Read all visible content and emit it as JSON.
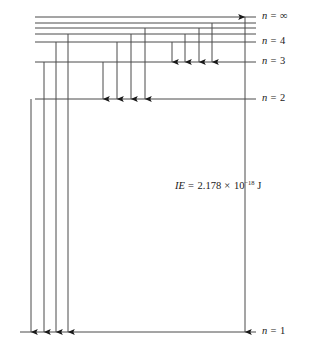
{
  "diagram": {
    "stroke_color": "#4a4a4a",
    "text_color": "#1a1a1a",
    "background": "#ffffff"
  },
  "levels": [
    {
      "id": "n-infinity",
      "label_n": "n",
      "label_eq": "=",
      "label_value": "∞",
      "y": 17,
      "x_start": 35,
      "x_end": 256,
      "label_x": 262,
      "label_y": 11
    },
    {
      "id": "n-7",
      "label_n": "",
      "label_eq": "",
      "label_value": "",
      "y": 23,
      "x_start": 35,
      "x_end": 256,
      "label_x": 0,
      "label_y": 0
    },
    {
      "id": "n-6",
      "label_n": "",
      "label_eq": "",
      "label_value": "",
      "y": 28,
      "x_start": 35,
      "x_end": 256,
      "label_x": 0,
      "label_y": 0
    },
    {
      "id": "n-5",
      "label_n": "",
      "label_eq": "",
      "label_value": "",
      "y": 34,
      "x_start": 35,
      "x_end": 256,
      "label_x": 0,
      "label_y": 0
    },
    {
      "id": "n-4",
      "label_n": "n",
      "label_eq": "=",
      "label_value": "4",
      "y": 42,
      "x_start": 35,
      "x_end": 256,
      "label_x": 262,
      "label_y": 36
    },
    {
      "id": "n-3",
      "label_n": "n",
      "label_eq": "=",
      "label_value": "3",
      "y": 62,
      "x_start": 35,
      "x_end": 256,
      "label_x": 262,
      "label_y": 56
    },
    {
      "id": "n-2",
      "label_n": "n",
      "label_eq": "=",
      "label_value": "2",
      "y": 99,
      "x_start": 35,
      "x_end": 256,
      "label_x": 262,
      "label_y": 93
    },
    {
      "id": "n-1",
      "label_n": "n",
      "label_eq": "=",
      "label_value": "1",
      "y": 332,
      "x_start": 20,
      "x_end": 256,
      "label_x": 262,
      "label_y": 326
    }
  ],
  "transitions": [
    {
      "id": "t-4-to-3",
      "x": 172,
      "y_from": 42,
      "y_to": 62,
      "direction": "down",
      "group": "to-n-3"
    },
    {
      "id": "t-5-to-3",
      "x": 185,
      "y_from": 34,
      "y_to": 62,
      "direction": "down",
      "group": "to-n-3"
    },
    {
      "id": "t-6-to-3",
      "x": 199,
      "y_from": 28,
      "y_to": 62,
      "direction": "down",
      "group": "to-n-3"
    },
    {
      "id": "t-7-to-3",
      "x": 212,
      "y_from": 23,
      "y_to": 62,
      "direction": "down",
      "group": "to-n-3"
    },
    {
      "id": "t-3-to-2",
      "x": 103,
      "y_from": 62,
      "y_to": 99,
      "direction": "down",
      "group": "to-n-2"
    },
    {
      "id": "t-4-to-2",
      "x": 117,
      "y_from": 42,
      "y_to": 99,
      "direction": "down",
      "group": "to-n-2"
    },
    {
      "id": "t-5-to-2",
      "x": 131,
      "y_from": 34,
      "y_to": 99,
      "direction": "down",
      "group": "to-n-2"
    },
    {
      "id": "t-6-to-2",
      "x": 145,
      "y_from": 28,
      "y_to": 99,
      "direction": "down",
      "group": "to-n-2"
    },
    {
      "id": "t-2-to-1",
      "x": 31,
      "y_from": 99,
      "y_to": 332,
      "direction": "down",
      "group": "to-n-1"
    },
    {
      "id": "t-3-to-1",
      "x": 44,
      "y_from": 62,
      "y_to": 332,
      "direction": "down",
      "group": "to-n-1"
    },
    {
      "id": "t-4-to-1",
      "x": 56,
      "y_from": 42,
      "y_to": 332,
      "direction": "down",
      "group": "to-n-1"
    },
    {
      "id": "t-5-to-1",
      "x": 68,
      "y_from": 34,
      "y_to": 332,
      "direction": "down",
      "group": "to-n-1"
    }
  ],
  "ionization": {
    "arrow": {
      "id": "ie-arrow",
      "x": 245,
      "y_top": 17,
      "y_bottom": 332,
      "direction": "both"
    },
    "label": {
      "symbol": "IE",
      "equals": "=",
      "mantissa": "2.178",
      "times": "×",
      "base": "10",
      "exponent": "−18",
      "unit": "J",
      "full_text": "IE = 2.178 × 10⁻¹⁸ J",
      "x": 175,
      "y": 181
    }
  }
}
